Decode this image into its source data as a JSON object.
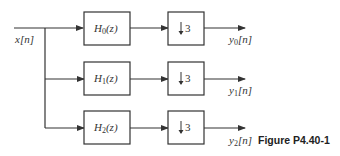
{
  "input": {
    "label": "x[n]"
  },
  "filters": [
    {
      "name": "H",
      "sub": "0",
      "arg": "(z)"
    },
    {
      "name": "H",
      "sub": "1",
      "arg": "(z)"
    },
    {
      "name": "H",
      "sub": "2",
      "arg": "(z)"
    }
  ],
  "downsamplers": [
    {
      "arrow": "↓",
      "factor": "3"
    },
    {
      "arrow": "↓",
      "factor": "3"
    },
    {
      "arrow": "↓",
      "factor": "3"
    }
  ],
  "outputs": [
    {
      "name": "y",
      "sub": "0",
      "arg": "[n]"
    },
    {
      "name": "y",
      "sub": "1",
      "arg": "[n]"
    },
    {
      "name": "y",
      "sub": "2",
      "arg": "[n]"
    }
  ],
  "caption": "Figure P4.40-1",
  "colors": {
    "line": "#333333",
    "text": "#333333",
    "background": "#ffffff"
  }
}
